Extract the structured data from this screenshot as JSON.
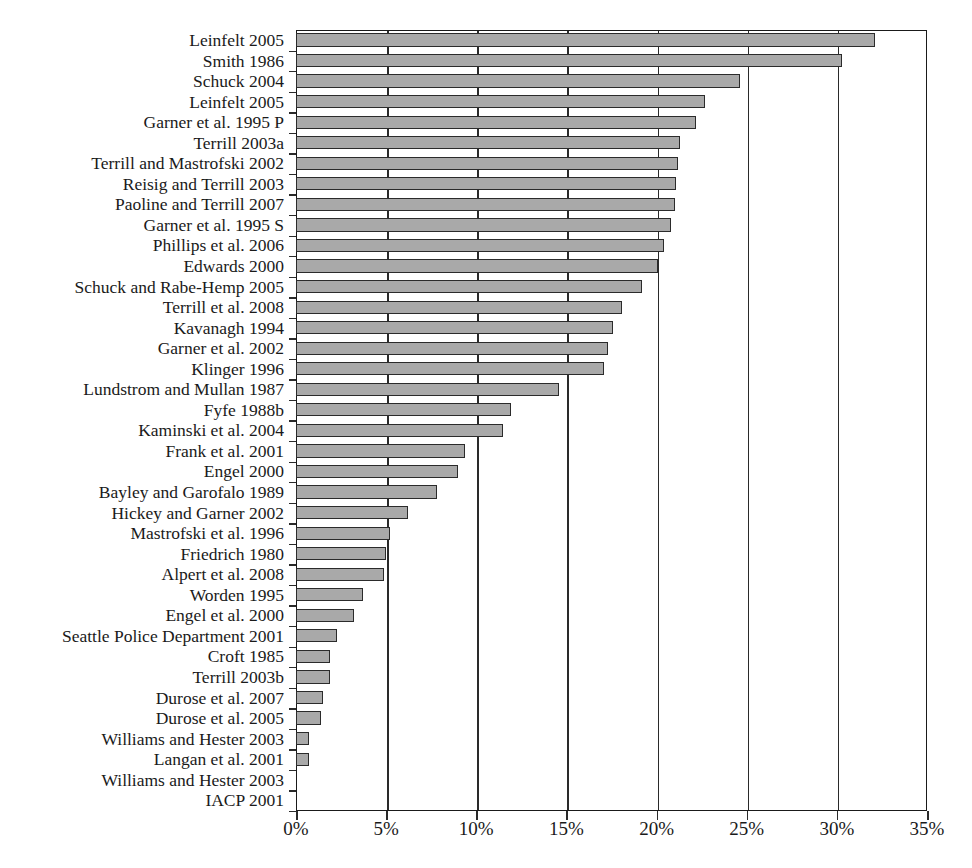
{
  "chart_data": {
    "type": "bar",
    "orientation": "horizontal",
    "title": "",
    "xlabel": "",
    "ylabel": "",
    "xlim": [
      0,
      35
    ],
    "xticks": [
      0,
      5,
      10,
      15,
      20,
      25,
      30,
      35
    ],
    "xtick_labels": [
      "0%",
      "5%",
      "10%",
      "15%",
      "20%",
      "25%",
      "30%",
      "35%"
    ],
    "grid": true,
    "legend": "none",
    "bar_color": "#a9a9a9",
    "bar_edge_color": "#2b2b2b",
    "categories": [
      "Leinfelt 2005",
      "Smith 1986",
      "Schuck 2004",
      "Leinfelt 2005",
      "Garner et al. 1995 P",
      "Terrill 2003a",
      "Terrill and Mastrofski 2002",
      "Reisig and Terrill 2003",
      "Paoline and Terrill 2007",
      "Garner et al. 1995 S",
      "Phillips et al. 2006",
      "Edwards 2000",
      "Schuck and Rabe-Hemp 2005",
      "Terrill et al. 2008",
      "Kavanagh 1994",
      "Garner et al. 2002",
      "Klinger 1996",
      "Lundstrom and Mullan 1987",
      "Fyfe 1988b",
      "Kaminski et al. 2004",
      "Frank et al. 2001",
      "Engel 2000",
      "Bayley and Garofalo 1989",
      "Hickey and Garner 2002",
      "Mastrofski et al. 1996",
      "Friedrich 1980",
      "Alpert et al. 2008",
      "Worden 1995",
      "Engel et al. 2000",
      "Seattle Police Department 2001",
      "Croft 1985",
      "Terrill 2003b",
      "Durose et al. 2007",
      "Durose et al. 2005",
      "Williams and Hester 2003",
      "Langan et al. 2001",
      "Williams and Hester 2003",
      "IACP 2001"
    ],
    "values": [
      32.1,
      30.3,
      24.6,
      22.7,
      22.2,
      21.3,
      21.2,
      21.1,
      21.0,
      20.8,
      20.4,
      20.1,
      19.2,
      18.1,
      17.6,
      17.3,
      17.1,
      14.6,
      11.9,
      11.5,
      9.4,
      9.0,
      7.8,
      6.2,
      5.2,
      5.0,
      4.9,
      3.7,
      3.2,
      2.3,
      1.9,
      1.9,
      1.5,
      1.4,
      0.7,
      0.7,
      0.0,
      0.0
    ],
    "value_labels": [
      "32.1%",
      "30.3%",
      "24.6%",
      "22.7%",
      "22.2%",
      "21.3%",
      "21.2%",
      "21.1%",
      "21.0%",
      "20.8%",
      "20.4%",
      "20.1%",
      "19.2%",
      "18.1%",
      "17.6%",
      "17.3%",
      "17.1%",
      "14.6%",
      "11.9%",
      "11.5%",
      "9.4%",
      "9.0%",
      "7.8%",
      "6.2%",
      "5.2%",
      "5.0%",
      "4.9%",
      "3.7%",
      "3.2%",
      "2.3%",
      "1.9%",
      "1.9%",
      "1.5%",
      "1.4%",
      "0.7%",
      "0.7%",
      "0.0%",
      "0.0%"
    ]
  }
}
